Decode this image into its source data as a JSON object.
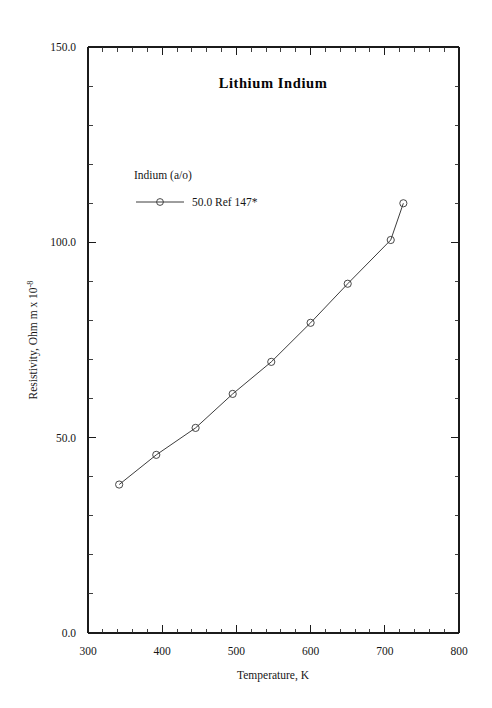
{
  "chart_data": {
    "type": "line",
    "title": "Lithium  Indium",
    "xlabel": "Temperature,  K",
    "ylabel_main": "Resistivity, Ohm m x 10",
    "ylabel_exponent": "-8",
    "xlim": [
      300,
      800
    ],
    "ylim": [
      0,
      150
    ],
    "grid": false,
    "x_ticks": [
      300,
      400,
      500,
      600,
      700,
      800
    ],
    "x_tick_labels": [
      "300",
      "400",
      "500",
      "600",
      "700",
      "800"
    ],
    "x_minor_interval": 20,
    "y_ticks": [
      0,
      50,
      100,
      150
    ],
    "y_tick_labels": [
      "0.0",
      "50.0",
      "100.0",
      "150.0"
    ],
    "y_minor_interval": 10,
    "legend_position": "upper-left-inside",
    "legend_title": "Indium (a/o)",
    "series": [
      {
        "name": "50.0 Ref 147*",
        "marker": "open-circle",
        "x": [
          342,
          392,
          445,
          495,
          547,
          600,
          650,
          708,
          725
        ],
        "y": [
          38.0,
          45.6,
          52.5,
          61.2,
          69.4,
          79.4,
          89.4,
          100.6,
          110.0
        ]
      }
    ]
  },
  "legend": {
    "title": "Indium (a/o)",
    "entries": [
      {
        "label": "50.0 Ref 147*"
      }
    ]
  },
  "axes": {
    "x_title": "Temperature,  K",
    "y_title_main": "Resistivity, Ohm m x 10",
    "y_title_exp": "-8"
  }
}
